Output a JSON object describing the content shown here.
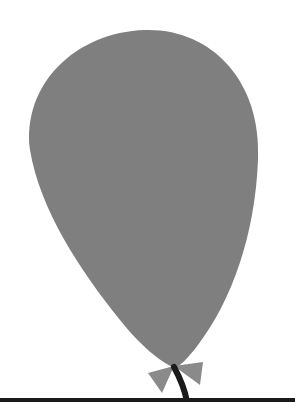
{
  "image": {
    "subject": "balloon",
    "description": "Gray balloon with a small bow at the knot and a black string, above a black baseline",
    "colors": {
      "background": "#ffffff",
      "balloon": "#7f7f7f",
      "bow": "#8a8a8a",
      "string": "#1a1a1a",
      "baseline": "#1a1a1a"
    }
  }
}
